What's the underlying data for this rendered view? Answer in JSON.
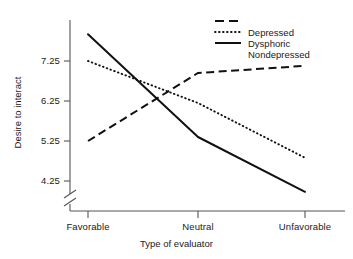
{
  "chart_data": {
    "type": "line",
    "title": "",
    "xlabel": "Type of evaluator",
    "ylabel": "Desire to interact",
    "categories": [
      "Favorable",
      "Neutral",
      "Unfavorable"
    ],
    "yticks": [
      "4.25",
      "5.25",
      "6.25",
      "7.25"
    ],
    "ytick_values": [
      4.25,
      5.25,
      6.25,
      7.25
    ],
    "ylim": [
      3.85,
      8.1
    ],
    "axis_break": true,
    "axis_break_note": "y-axis broken below 4.25",
    "grid": false,
    "legend_position": "top-right",
    "series": [
      {
        "name": "Depressed",
        "style": "dashed",
        "color": "#111111",
        "values": [
          5.25,
          6.95,
          7.13
        ]
      },
      {
        "name": "Dysphoric",
        "style": "dotted",
        "color": "#111111",
        "values": [
          7.25,
          6.2,
          4.83
        ]
      },
      {
        "name": "Nondepressed",
        "style": "solid",
        "color": "#111111",
        "values": [
          7.92,
          5.35,
          3.98
        ]
      }
    ]
  },
  "axes": {
    "ylabel": "Desire to interact",
    "xlabel": "Type of evaluator",
    "ytick_0": "4.25",
    "ytick_1": "5.25",
    "ytick_2": "6.25",
    "ytick_3": "7.25",
    "xtick_0": "Favorable",
    "xtick_1": "Neutral",
    "xtick_2": "Unfavorable"
  },
  "legend": {
    "item_0": "Depressed",
    "item_1": "Dysphoric",
    "item_2": "Nondepressed"
  },
  "colors": {
    "line": "#111111",
    "axis": "#555555",
    "text": "#1a1a1a",
    "background": "#ffffff"
  }
}
